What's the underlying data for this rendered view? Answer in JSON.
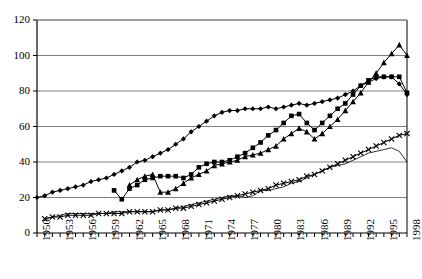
{
  "chart_data": {
    "type": "line",
    "title": "",
    "xlabel": "",
    "ylabel": "",
    "xlim": [
      1950,
      1998
    ],
    "ylim": [
      0,
      120
    ],
    "ytick_step": 20,
    "yticks": [
      0,
      20,
      40,
      60,
      80,
      100,
      120
    ],
    "xtick_step": 1,
    "xlabel_step": 3,
    "xticklabels": [
      "1950",
      "1953",
      "1956",
      "1959",
      "1962",
      "1965",
      "1968",
      "1971",
      "1974",
      "1977",
      "1980",
      "1983",
      "1986",
      "1989",
      "1992",
      "1995",
      "1998"
    ],
    "grid": "horizontal",
    "legend": "none",
    "colors": {
      "series": "#000000",
      "grid": "#808080",
      "axis": "#000000"
    },
    "series": [
      {
        "name": "series-diamond",
        "marker": "diamond",
        "style": "marked-line",
        "x": [
          1950,
          1951,
          1952,
          1953,
          1954,
          1955,
          1956,
          1957,
          1958,
          1959,
          1960,
          1961,
          1962,
          1963,
          1964,
          1965,
          1966,
          1967,
          1968,
          1969,
          1970,
          1971,
          1972,
          1973,
          1974,
          1975,
          1976,
          1977,
          1978,
          1979,
          1980,
          1981,
          1982,
          1983,
          1984,
          1985,
          1986,
          1987,
          1988,
          1989,
          1990,
          1991,
          1992,
          1993,
          1994,
          1995,
          1996,
          1997,
          1998
        ],
        "y": [
          20,
          21,
          23,
          24,
          25,
          26,
          27,
          29,
          30,
          31,
          33,
          35,
          37,
          40,
          41,
          43,
          45,
          47,
          50,
          53,
          57,
          60,
          63,
          66,
          68,
          69,
          69,
          70,
          70,
          70,
          71,
          70,
          71,
          72,
          73,
          72,
          73,
          74,
          75,
          76,
          78,
          80,
          83,
          85,
          87,
          88,
          88,
          84,
          78
        ]
      },
      {
        "name": "series-square",
        "marker": "square",
        "style": "marked-line",
        "x": [
          1960,
          1961,
          1962,
          1963,
          1964,
          1965,
          1966,
          1967,
          1968,
          1969,
          1970,
          1971,
          1972,
          1973,
          1974,
          1975,
          1976,
          1977,
          1978,
          1979,
          1980,
          1981,
          1982,
          1983,
          1984,
          1985,
          1986,
          1987,
          1988,
          1989,
          1990,
          1991,
          1992,
          1993,
          1994,
          1995,
          1996,
          1997,
          1998
        ],
        "y": [
          24,
          19,
          25,
          27,
          30,
          31,
          32,
          32,
          32,
          31,
          33,
          37,
          39,
          40,
          40,
          41,
          43,
          45,
          48,
          51,
          55,
          58,
          62,
          66,
          67,
          62,
          58,
          62,
          66,
          70,
          73,
          78,
          83,
          86,
          88,
          88,
          88,
          88,
          79
        ]
      },
      {
        "name": "series-triangle",
        "marker": "triangle",
        "style": "marked-line",
        "x": [
          1962,
          1963,
          1964,
          1965,
          1966,
          1967,
          1968,
          1969,
          1970,
          1971,
          1972,
          1973,
          1974,
          1975,
          1976,
          1977,
          1978,
          1979,
          1980,
          1981,
          1982,
          1983,
          1984,
          1985,
          1986,
          1987,
          1988,
          1989,
          1990,
          1991,
          1992,
          1993,
          1994,
          1995,
          1996,
          1997,
          1998
        ],
        "y": [
          27,
          30,
          32,
          33,
          23,
          23,
          25,
          28,
          31,
          33,
          35,
          38,
          39,
          40,
          41,
          43,
          44,
          45,
          47,
          49,
          53,
          56,
          59,
          57,
          53,
          56,
          60,
          64,
          69,
          74,
          79,
          85,
          90,
          96,
          101,
          106,
          100
        ]
      },
      {
        "name": "series-cross",
        "marker": "cross",
        "style": "marked-line",
        "x": [
          1951,
          1952,
          1953,
          1954,
          1955,
          1956,
          1957,
          1958,
          1959,
          1960,
          1961,
          1962,
          1963,
          1964,
          1965,
          1966,
          1967,
          1968,
          1969,
          1970,
          1971,
          1972,
          1973,
          1974,
          1975,
          1976,
          1977,
          1978,
          1979,
          1980,
          1981,
          1982,
          1983,
          1984,
          1985,
          1986,
          1987,
          1988,
          1989,
          1990,
          1991,
          1992,
          1993,
          1994,
          1995,
          1996,
          1997,
          1998
        ],
        "y": [
          8,
          9,
          9,
          10,
          10,
          10,
          10,
          11,
          11,
          11,
          11,
          12,
          12,
          12,
          12,
          13,
          13,
          14,
          14,
          15,
          16,
          17,
          18,
          19,
          20,
          21,
          22,
          23,
          24,
          25,
          27,
          28,
          29,
          30,
          32,
          33,
          35,
          37,
          39,
          41,
          43,
          45,
          47,
          49,
          51,
          53,
          55,
          56
        ]
      },
      {
        "name": "series-plain-line",
        "marker": "none",
        "style": "thin-line",
        "x": [
          1951,
          1952,
          1953,
          1954,
          1955,
          1956,
          1957,
          1958,
          1959,
          1960,
          1961,
          1962,
          1963,
          1964,
          1965,
          1966,
          1967,
          1968,
          1969,
          1970,
          1971,
          1972,
          1973,
          1974,
          1975,
          1976,
          1977,
          1978,
          1979,
          1980,
          1981,
          1982,
          1983,
          1984,
          1985,
          1986,
          1987,
          1988,
          1989,
          1990,
          1991,
          1992,
          1993,
          1994,
          1995,
          1996,
          1997,
          1998
        ],
        "y": [
          8,
          9,
          10,
          11,
          11,
          11,
          11,
          11,
          11,
          12,
          12,
          12,
          12,
          12,
          12,
          13,
          13,
          14,
          15,
          16,
          17,
          18,
          19,
          20,
          21,
          21,
          20,
          21,
          24,
          24,
          25,
          26,
          28,
          29,
          31,
          33,
          35,
          37,
          38,
          39,
          41,
          43,
          45,
          46,
          47,
          48,
          46,
          40
        ]
      }
    ]
  }
}
